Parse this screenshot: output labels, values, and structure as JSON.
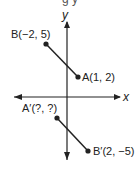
{
  "diagram": {
    "type": "coordinate-plane-reflection",
    "top_fragment": "g y",
    "axes": {
      "x_label": "x",
      "y_label": "y"
    },
    "points": [
      {
        "id": "B",
        "label": "B(−2, 5)",
        "x": -2,
        "y": 5
      },
      {
        "id": "A",
        "label": "A(1, 2)",
        "x": 1,
        "y": 2
      },
      {
        "id": "A_prime",
        "label": "A′(?, ?)",
        "x": null,
        "y": null
      },
      {
        "id": "B_prime",
        "label": "B′(2, −5)",
        "x": 2,
        "y": -5
      }
    ],
    "segments": [
      {
        "from": "B",
        "to": "A"
      },
      {
        "from": "A_prime",
        "to": "B_prime"
      }
    ],
    "colors": {
      "ink": "#222222",
      "background": "#ffffff"
    }
  }
}
